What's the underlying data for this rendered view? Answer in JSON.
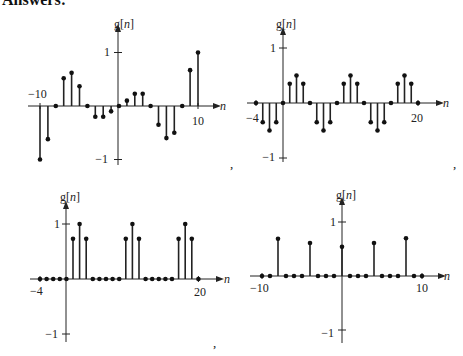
{
  "header": "Answers:",
  "separators": [
    ",",
    ",",
    ",",
    ""
  ],
  "chart_data": [
    {
      "type": "stem",
      "title": "",
      "ylabel": "g[n]",
      "xlabel": "n",
      "xlim": [
        -10,
        10
      ],
      "ylim": [
        -1,
        1
      ],
      "xtick_labels": [
        "-10",
        "10"
      ],
      "ytick_labels": [
        "1",
        "-1"
      ],
      "x": [
        -10,
        -9,
        -8,
        -7,
        -6,
        -5,
        -4,
        -3,
        -2,
        -1,
        0,
        1,
        2,
        3,
        4,
        5,
        6,
        7,
        8,
        9,
        10
      ],
      "values": [
        -1.0,
        -0.62,
        0,
        0.52,
        0.62,
        0.37,
        0,
        -0.2,
        -0.2,
        -0.1,
        0,
        0.1,
        0.23,
        0.23,
        0,
        -0.35,
        -0.6,
        -0.5,
        0,
        0.67,
        1.0
      ]
    },
    {
      "type": "stem",
      "title": "",
      "ylabel": "g[n]",
      "xlabel": "n",
      "xlim": [
        -4,
        20
      ],
      "ylim": [
        -1,
        1
      ],
      "xtick_labels": [
        "-4",
        "20"
      ],
      "ytick_labels": [
        "1",
        "-1"
      ],
      "x": [
        -4,
        -3,
        -2,
        -1,
        0,
        1,
        2,
        3,
        4,
        5,
        6,
        7,
        8,
        9,
        10,
        11,
        12,
        13,
        14,
        15,
        16,
        17,
        18,
        19,
        20
      ],
      "values": [
        0,
        -0.35,
        -0.5,
        -0.35,
        0,
        0.35,
        0.5,
        0.35,
        0,
        -0.35,
        -0.5,
        -0.35,
        0,
        0.35,
        0.5,
        0.35,
        0,
        -0.35,
        -0.5,
        -0.35,
        0,
        0.35,
        0.5,
        0.35,
        0
      ]
    },
    {
      "type": "stem",
      "title": "",
      "ylabel": "g[n]",
      "xlabel": "n",
      "xlim": [
        -4,
        20
      ],
      "ylim": [
        -1,
        1
      ],
      "xtick_labels": [
        "-4",
        "20"
      ],
      "ytick_labels": [
        "1",
        "-1"
      ],
      "x": [
        -4,
        -3,
        -2,
        -1,
        0,
        1,
        2,
        3,
        4,
        5,
        6,
        7,
        8,
        9,
        10,
        11,
        12,
        13,
        14,
        15,
        16,
        17,
        18,
        19,
        20
      ],
      "values": [
        0,
        0,
        0,
        0,
        0,
        0.73,
        1.0,
        0.73,
        0,
        0,
        0,
        0,
        0,
        0.73,
        1.0,
        0.73,
        0,
        0,
        0,
        0,
        0,
        0.73,
        1.0,
        0.73,
        0
      ]
    },
    {
      "type": "stem",
      "title": "",
      "ylabel": "g[n]",
      "xlabel": "n",
      "xlim": [
        -10,
        10
      ],
      "ylim": [
        -1,
        1
      ],
      "xtick_labels": [
        "-10",
        "10"
      ],
      "ytick_labels": [
        "1",
        "-1"
      ],
      "x": [
        -10,
        -9,
        -8,
        -7,
        -6,
        -5,
        -4,
        -3,
        -2,
        -1,
        0,
        1,
        2,
        3,
        4,
        5,
        6,
        7,
        8,
        9,
        10
      ],
      "values": [
        0,
        0,
        0.69,
        0,
        0,
        0,
        0.61,
        0,
        0,
        0,
        0.54,
        0,
        0,
        0,
        0.61,
        0,
        0,
        0,
        0.7,
        0,
        0
      ]
    }
  ],
  "layout": [
    {
      "x0": 40,
      "dx": 7.9,
      "yaxis_x": 118,
      "y0": 106,
      "unit": 53.5,
      "xmin": 28,
      "xmax": 215,
      "ytop": 30,
      "ybot": 165,
      "labels": {
        "g": [
          114,
          28
        ],
        "n": [
          220,
          110
        ],
        "xl": [
          [
            28,
            98,
            "start"
          ],
          [
            198,
            125,
            "middle"
          ]
        ],
        "y1": [
          110,
          56
        ],
        "ym1": [
          108,
          163
        ]
      }
    },
    {
      "x0": 256,
      "dx": 6.75,
      "yaxis_x": 283,
      "y0": 103,
      "unit": 55,
      "xmin": 247,
      "xmax": 438,
      "ytop": 33,
      "ybot": 162,
      "labels": {
        "g": [
          276,
          28
        ],
        "n": [
          443,
          107
        ],
        "xl": [
          [
            246,
            122,
            "start"
          ],
          [
            417,
            122,
            "middle"
          ]
        ],
        "y1": [
          276,
          52
        ],
        "ym1": [
          275,
          161
        ]
      }
    },
    {
      "x0": 40,
      "dx": 6.6,
      "yaxis_x": 66,
      "y0": 279,
      "unit": 55,
      "xmin": 30,
      "xmax": 218,
      "ytop": 207,
      "ybot": 342,
      "labels": {
        "g": [
          60,
          201
        ],
        "n": [
          224,
          283
        ],
        "xl": [
          [
            30,
            295,
            "start"
          ],
          [
            200,
            296,
            "middle"
          ]
        ],
        "y1": [
          60,
          228
        ],
        "ym1": [
          58,
          338
        ]
      }
    },
    {
      "x0": 262,
      "dx": 8,
      "yaxis_x": 342,
      "y0": 276,
      "unit": 54,
      "xmin": 250,
      "xmax": 440,
      "ytop": 203,
      "ybot": 343,
      "labels": {
        "g": [
          336,
          199
        ],
        "n": [
          444,
          280
        ],
        "xl": [
          [
            250,
            292,
            "start"
          ],
          [
            422,
            292,
            "middle"
          ]
        ],
        "y1": [
          336,
          226
        ],
        "ym1": [
          334,
          337
        ]
      }
    }
  ],
  "separator_positions": [
    [
      230,
      164
    ],
    [
      453,
      164
    ],
    [
      213,
      343
    ],
    [
      0,
      0
    ]
  ]
}
